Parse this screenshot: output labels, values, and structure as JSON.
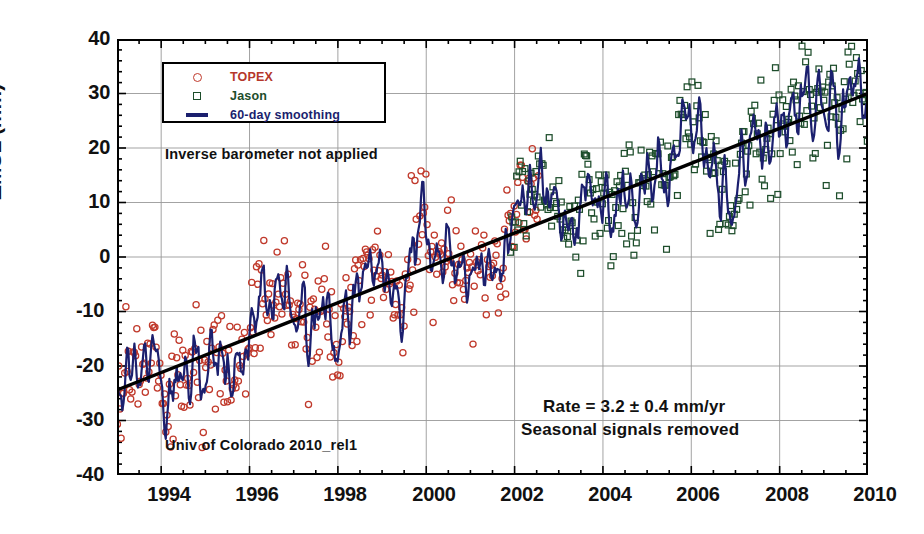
{
  "chart_data": {
    "type": "scatter",
    "title": "",
    "xlabel": "",
    "ylabel": "ΔMSL  (mm)",
    "xlim": [
      1993.0,
      2010.0
    ],
    "ylim": [
      -40,
      40
    ],
    "xticks": [
      1994,
      1996,
      1998,
      2000,
      2002,
      2004,
      2006,
      2008,
      2010
    ],
    "yticks": [
      40,
      30,
      20,
      10,
      0,
      -10,
      -20,
      -30,
      -40
    ],
    "xtick_labels": [
      "1994",
      "1996",
      "1998",
      "2000",
      "2002",
      "2004",
      "2006",
      "2008",
      "2010"
    ],
    "ytick_labels": [
      "40",
      "30",
      "20",
      "10",
      "0",
      "-10",
      "-20",
      "-30",
      "-40"
    ],
    "x_minor_step": 0.5,
    "y_minor_step": 2,
    "grid": true,
    "grid_color": "#999999",
    "legend_position": "top-left",
    "series": [
      {
        "name": "TOPEX",
        "marker": "open-circle",
        "color": "#c0392b",
        "x_range": [
          1993.0,
          2002.3
        ],
        "note": "raw 10-day cycle ΔMSL estimates, scatter about trend ± 8 mm"
      },
      {
        "name": "Jason",
        "marker": "open-square",
        "color": "#1d4d2b",
        "x_range": [
          2002.0,
          2010.0
        ],
        "note": "raw 10-day cycle ΔMSL estimates, scatter about trend ± 8 mm"
      },
      {
        "name": "60-day smoothing",
        "marker": "line",
        "color": "#1b1f6e",
        "x_range": [
          1993.0,
          2010.0
        ],
        "note": "60-day running mean through combined TOPEX + Jason series"
      },
      {
        "name": "linear trend",
        "marker": "line",
        "color": "#000000",
        "x_range": [
          1993.0,
          2010.0
        ],
        "y_endpoints": [
          -24.4,
          30.0
        ],
        "slope_mm_per_yr": 3.2
      }
    ],
    "trend_rate_mm_per_yr": 3.2,
    "trend_uncertainty_mm_per_yr": 0.4,
    "annotations": [
      "Inverse barometer not applied",
      "Rate = 3.2 ± 0.4 mm/yr",
      "Seasonal signals removed",
      "Univ of Colorado 2010_rel1"
    ]
  },
  "legend": {
    "items": [
      {
        "label": "TOPEX",
        "symbol": "open-circle",
        "color": "#b5372b"
      },
      {
        "label": "Jason",
        "symbol": "open-square",
        "color": "#1d4d2b"
      },
      {
        "label": "60-day smoothing",
        "symbol": "line",
        "color": "#1b1f6e"
      }
    ]
  },
  "annotations": {
    "inverse_barometer": "Inverse barometer not applied",
    "rate": "Rate = 3.2 ± 0.4 mm/yr",
    "seasonal": "Seasonal signals removed",
    "source": "Univ of Colorado 2010_rel1"
  },
  "axes": {
    "y_title": "ΔMSL  (mm)",
    "y_labels": [
      "40",
      "30",
      "20",
      "10",
      "0",
      "-10",
      "-20",
      "-30",
      "-40"
    ],
    "x_labels": [
      "1994",
      "1996",
      "1998",
      "2000",
      "2002",
      "2004",
      "2006",
      "2008",
      "2010"
    ]
  }
}
